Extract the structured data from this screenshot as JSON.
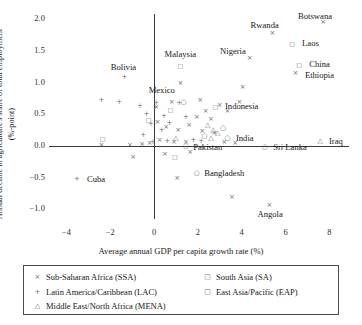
{
  "chart_data": {
    "type": "scatter",
    "title": "",
    "xlabel": "Average annual GDP per capita growth rate (%)",
    "ylabel": "Annual decline in agriculture's share of total employment (%-point)",
    "xlim": [
      -4.8,
      8.9
    ],
    "ylim": [
      -1.15,
      2.08
    ],
    "xticks": [
      -4,
      -2,
      0,
      2,
      4,
      6,
      8
    ],
    "xtick_labels": [
      "−4",
      "−2",
      "0",
      "2",
      "4",
      "6",
      "8"
    ],
    "yticks": [
      -1.0,
      -0.5,
      0.0,
      0.5,
      1.0,
      1.5,
      2.0
    ],
    "ytick_labels": [
      "−1.0",
      "−0.5",
      "0.0",
      "0.5",
      "1.0",
      "1.5",
      "2.0"
    ],
    "grid": false,
    "legend_position": "below-axes",
    "series": [
      {
        "name": "Sub-Saharan Africa (SSA)",
        "key": "SSA",
        "marker": "×",
        "marker_class": "x",
        "color": "#6d6d6d",
        "points": [
          {
            "x": 7.72,
            "y": 1.95,
            "label": "Botswana"
          },
          {
            "x": 5.4,
            "y": 1.78,
            "label": "Rwanda"
          },
          {
            "x": 4.36,
            "y": 1.38,
            "label": "Nigeria"
          },
          {
            "x": 6.45,
            "y": 1.15,
            "label": "Ethiopia"
          },
          {
            "x": 5.27,
            "y": -0.93,
            "label": "Angola"
          },
          {
            "x": 4.05,
            "y": 0.93,
            "label": ""
          },
          {
            "x": 1.2,
            "y": 1.0,
            "label": ""
          },
          {
            "x": 3.0,
            "y": 0.64,
            "label": ""
          },
          {
            "x": 2.36,
            "y": 0.55,
            "label": ""
          },
          {
            "x": 1.95,
            "y": 0.45,
            "label": ""
          },
          {
            "x": 2.6,
            "y": 0.42,
            "label": ""
          },
          {
            "x": 3.35,
            "y": 0.55,
            "label": ""
          },
          {
            "x": 1.6,
            "y": 0.33,
            "label": ""
          },
          {
            "x": 2.2,
            "y": 0.23,
            "label": ""
          },
          {
            "x": 2.75,
            "y": 0.2,
            "label": ""
          },
          {
            "x": 1.1,
            "y": 0.25,
            "label": ""
          },
          {
            "x": 0.55,
            "y": 0.3,
            "label": ""
          },
          {
            "x": 0.15,
            "y": 0.38,
            "label": ""
          },
          {
            "x": 0.25,
            "y": 0.1,
            "label": ""
          },
          {
            "x": 0.9,
            "y": 0.06,
            "label": ""
          },
          {
            "x": 1.45,
            "y": 0.06,
            "label": ""
          },
          {
            "x": 3.2,
            "y": 0.06,
            "label": ""
          },
          {
            "x": 3.7,
            "y": 0.05,
            "label": ""
          },
          {
            "x": -0.55,
            "y": 0.03,
            "label": ""
          },
          {
            "x": -1.1,
            "y": 0.02,
            "label": ""
          },
          {
            "x": -2.4,
            "y": 0.02,
            "label": ""
          },
          {
            "x": 0.5,
            "y": -0.12,
            "label": ""
          },
          {
            "x": 1.65,
            "y": -0.1,
            "label": ""
          },
          {
            "x": -0.95,
            "y": -0.18,
            "label": ""
          },
          {
            "x": 1.05,
            "y": -0.5,
            "label": ""
          },
          {
            "x": 0.1,
            "y": 0.62,
            "label": ""
          },
          {
            "x": 3.9,
            "y": 0.7,
            "label": ""
          },
          {
            "x": 0.8,
            "y": 0.7,
            "label": ""
          },
          {
            "x": -0.2,
            "y": 0.05,
            "label": ""
          },
          {
            "x": 2.1,
            "y": 0.72,
            "label": ""
          },
          {
            "x": 3.55,
            "y": -0.8,
            "label": ""
          }
        ]
      },
      {
        "name": "Latin America/Caribbean (LAC)",
        "key": "LAC",
        "marker": "+",
        "marker_class": "plus",
        "color": "#6d6d6d",
        "points": [
          {
            "x": -1.36,
            "y": 1.09,
            "label": "Bolivia"
          },
          {
            "x": -3.52,
            "y": -0.52,
            "label": "Cuba"
          },
          {
            "x": -2.4,
            "y": 0.72,
            "label": ""
          },
          {
            "x": -1.6,
            "y": 0.7,
            "label": ""
          },
          {
            "x": -0.65,
            "y": 0.63,
            "label": ""
          },
          {
            "x": 0.1,
            "y": 0.68,
            "label": ""
          },
          {
            "x": 1.15,
            "y": 0.67,
            "label": ""
          },
          {
            "x": 0.45,
            "y": 0.48,
            "label": ""
          },
          {
            "x": 1.45,
            "y": 0.45,
            "label": ""
          },
          {
            "x": 0.7,
            "y": 0.36,
            "label": ""
          },
          {
            "x": -0.15,
            "y": 0.35,
            "label": ""
          },
          {
            "x": -0.35,
            "y": 0.5,
            "label": ""
          },
          {
            "x": 0.35,
            "y": 0.25,
            "label": ""
          },
          {
            "x": 1.8,
            "y": 0.1,
            "label": ""
          },
          {
            "x": 0.6,
            "y": 0.08,
            "label": ""
          },
          {
            "x": -0.05,
            "y": 0.07,
            "label": ""
          },
          {
            "x": 2.15,
            "y": 0.08,
            "label": ""
          },
          {
            "x": -0.5,
            "y": 0.18,
            "label": ""
          }
        ]
      },
      {
        "name": "Middle East/North Africa (MENA)",
        "key": "MENA",
        "marker": "△",
        "marker_class": "tr",
        "color": "#6d6d6d",
        "points": [
          {
            "x": 7.58,
            "y": 0.08,
            "label": "Iraq"
          },
          {
            "x": 2.45,
            "y": 0.33,
            "label": ""
          },
          {
            "x": 2.7,
            "y": 0.25,
            "label": ""
          },
          {
            "x": 2.9,
            "y": 0.2,
            "label": ""
          },
          {
            "x": 2.6,
            "y": 0.13,
            "label": ""
          },
          {
            "x": 1.0,
            "y": 0.13,
            "label": ""
          }
        ]
      },
      {
        "name": "South Asia (SA)",
        "key": "SA",
        "marker": "○",
        "marker_class": "ci",
        "color": "#6d6d6d",
        "points": [
          {
            "x": 3.35,
            "y": 0.13,
            "label": "India"
          },
          {
            "x": 1.45,
            "y": 0.0,
            "label": "Pakistan"
          },
          {
            "x": 5.05,
            "y": -0.02,
            "label": "Sri Lanka"
          },
          {
            "x": 1.95,
            "y": -0.42,
            "label": "Bangladesh"
          },
          {
            "x": 1.35,
            "y": 0.7,
            "label": ""
          },
          {
            "x": 3.15,
            "y": 0.28,
            "label": ""
          },
          {
            "x": 2.3,
            "y": 0.15,
            "label": ""
          }
        ]
      },
      {
        "name": "East Asia/Pacific (EAP)",
        "key": "EAP",
        "marker": "□",
        "marker_class": "sq",
        "color": "#6d6d6d",
        "points": [
          {
            "x": 6.3,
            "y": 1.62,
            "label": "Laos"
          },
          {
            "x": 6.62,
            "y": 1.3,
            "label": "China"
          },
          {
            "x": 1.2,
            "y": 1.28,
            "label": "Malaysia"
          },
          {
            "x": 2.8,
            "y": 0.63,
            "label": "Indonesia"
          },
          {
            "x": 0.75,
            "y": 0.58,
            "label": ""
          },
          {
            "x": -2.35,
            "y": 0.12,
            "label": ""
          },
          {
            "x": 0.95,
            "y": -0.15,
            "label": ""
          },
          {
            "x": -0.25,
            "y": 0.42,
            "label": ""
          }
        ]
      }
    ],
    "annotations": [
      {
        "text": "Botswana",
        "x": 7.35,
        "y": 2.05,
        "anchor": "center"
      },
      {
        "text": "Rwanda",
        "x": 5.05,
        "y": 1.9,
        "anchor": "center"
      },
      {
        "text": "Laos",
        "x": 6.62,
        "y": 1.62,
        "anchor": "left"
      },
      {
        "text": "Nigeria",
        "x": 3.6,
        "y": 1.5,
        "anchor": "center"
      },
      {
        "text": "China",
        "x": 6.95,
        "y": 1.3,
        "anchor": "left"
      },
      {
        "text": "Ethiopia",
        "x": 6.75,
        "y": 1.12,
        "anchor": "left"
      },
      {
        "text": "Malaysia",
        "x": 1.2,
        "y": 1.45,
        "anchor": "center"
      },
      {
        "text": "Bolivia",
        "x": -1.4,
        "y": 1.24,
        "anchor": "center"
      },
      {
        "text": "Mexico",
        "x": 0.35,
        "y": 0.88,
        "anchor": "center"
      },
      {
        "text": "Indonesia",
        "x": 3.1,
        "y": 0.63,
        "anchor": "left"
      },
      {
        "text": "India",
        "x": 3.6,
        "y": 0.12,
        "anchor": "left"
      },
      {
        "text": "Iraq",
        "x": 7.85,
        "y": 0.08,
        "anchor": "left"
      },
      {
        "text": "Pakistan",
        "x": 1.65,
        "y": -0.02,
        "anchor": "left"
      },
      {
        "text": "Sri Lanka",
        "x": 5.3,
        "y": -0.02,
        "anchor": "left"
      },
      {
        "text": "Cuba",
        "x": -3.2,
        "y": -0.52,
        "anchor": "left"
      },
      {
        "text": "Bangladesh",
        "x": 2.15,
        "y": -0.42,
        "anchor": "left"
      },
      {
        "text": "Angola",
        "x": 5.3,
        "y": -1.07,
        "anchor": "center"
      }
    ]
  },
  "legend": {
    "entries": [
      {
        "marker": "×",
        "label": "Sub-Saharan Africa (SSA)",
        "column": "left"
      },
      {
        "marker": "+",
        "label": "Latin America/Caribbean (LAC)",
        "column": "left"
      },
      {
        "marker": "△",
        "label": "Middle East/North Africa (MENA)",
        "column": "left"
      },
      {
        "marker": "□",
        "label": "South Asia (SA)",
        "column": "right"
      },
      {
        "marker": "□",
        "label": "East Asia/Pacific (EAP)",
        "column": "right"
      }
    ]
  },
  "colors": {
    "marker": "#6d6d6d",
    "axis": "#3a3a3a",
    "text": "#161616",
    "background": "#ffffff"
  }
}
